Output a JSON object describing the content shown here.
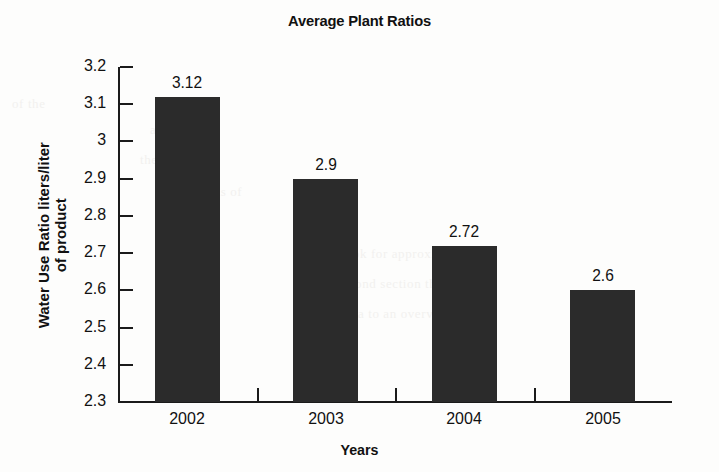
{
  "chart_data": {
    "type": "bar",
    "title": "Average Plant Ratios",
    "xlabel": "Years",
    "ylabel_line1": "Water Use Ratio liters/liter",
    "ylabel_line2": "of product",
    "ylabel": "Water Use Ratio liters/liter of product",
    "categories": [
      "2002",
      "2003",
      "2004",
      "2005"
    ],
    "values": [
      3.12,
      2.9,
      2.72,
      2.6
    ],
    "value_labels": [
      "3.12",
      "2.9",
      "2.72",
      "2.6"
    ],
    "ylim": [
      2.3,
      3.2
    ],
    "ytick_values": [
      3.2,
      3.1,
      3.0,
      2.9,
      2.8,
      2.7,
      2.6,
      2.5,
      2.4,
      2.3
    ],
    "ytick_labels": [
      "3.2",
      "3.1",
      "3",
      "2.9",
      "2.8",
      "2.7",
      "2.6",
      "2.5",
      "2.4",
      "2.3"
    ],
    "grid": false,
    "legend": false,
    "bar_color": "#2b2b2b",
    "axis_color": "#1b1b1b",
    "background_color": "#fdfdfc"
  },
  "ghost_text": [
    "of the",
    "a study",
    "the lines of",
    "in the areas of",
    "a little",
    "the look for approximately",
    "in the second section the results",
    "or any area to an overview about"
  ]
}
